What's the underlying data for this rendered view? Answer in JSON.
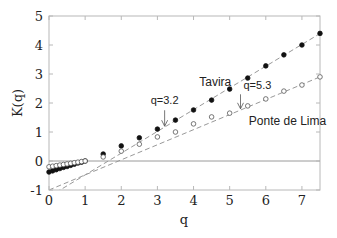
{
  "chart_data": {
    "type": "scatter",
    "title": "",
    "xlabel": "q",
    "ylabel": "K(q)",
    "xlim": [
      0,
      7.5
    ],
    "ylim": [
      -1,
      5
    ],
    "xticks": [
      0,
      1,
      2,
      3,
      4,
      5,
      6,
      7
    ],
    "yticks": [
      -1,
      0,
      1,
      2,
      3,
      4,
      5
    ],
    "grid": false,
    "zero_line": true,
    "series": [
      {
        "name": "Tavira",
        "marker": "filled-circle",
        "color": "#111111",
        "x": [
          0,
          0.1,
          0.2,
          0.3,
          0.4,
          0.5,
          0.6,
          0.7,
          0.8,
          0.9,
          1.0,
          1.5,
          2.0,
          2.5,
          3.0,
          3.5,
          4.0,
          4.5,
          5.0,
          5.5,
          6.0,
          6.5,
          7.0,
          7.5
        ],
        "y": [
          -0.38,
          -0.34,
          -0.3,
          -0.26,
          -0.22,
          -0.19,
          -0.15,
          -0.11,
          -0.07,
          -0.04,
          0.0,
          0.24,
          0.52,
          0.8,
          1.1,
          1.41,
          1.76,
          2.1,
          2.48,
          2.86,
          3.28,
          3.66,
          4.0,
          4.4
        ]
      },
      {
        "name": "Ponte de Lima",
        "marker": "open-circle",
        "color": "#555555",
        "x": [
          0,
          0.1,
          0.2,
          0.3,
          0.4,
          0.5,
          0.6,
          0.7,
          0.8,
          0.9,
          1.0,
          1.5,
          2.0,
          2.5,
          3.0,
          3.5,
          4.0,
          4.5,
          5.0,
          5.5,
          6.0,
          6.5,
          7.0,
          7.5
        ],
        "y": [
          -0.2,
          -0.18,
          -0.16,
          -0.14,
          -0.12,
          -0.1,
          -0.08,
          -0.06,
          -0.04,
          -0.02,
          0.0,
          0.14,
          0.34,
          0.58,
          0.83,
          1.0,
          1.28,
          1.52,
          1.65,
          1.9,
          2.14,
          2.41,
          2.62,
          2.9
        ]
      }
    ],
    "fit_lines": [
      {
        "name": "Tavira fit",
        "slope": 0.75,
        "intercept": -1.23,
        "style": "dashed",
        "color": "#999999"
      },
      {
        "name": "Ponte de Lima fit",
        "slope": 0.52,
        "intercept": -1.0,
        "style": "dashed",
        "color": "#999999"
      }
    ],
    "annotations": [
      {
        "text": "Tavira",
        "x": 4.6,
        "y": 2.6,
        "kind": "series-label"
      },
      {
        "text": "Ponte de Lima",
        "x": 6.6,
        "y": 1.25,
        "kind": "series-label"
      },
      {
        "text": "q=3.2",
        "x": 3.2,
        "label_y": 1.95,
        "arrow_from_y": 1.75,
        "arrow_to_y": 1.2,
        "kind": "arrow"
      },
      {
        "text": "q=5.3",
        "x": 5.3,
        "label_y": 2.5,
        "arrow_from_y": 2.3,
        "arrow_to_y": 1.8,
        "kind": "arrow"
      }
    ]
  }
}
